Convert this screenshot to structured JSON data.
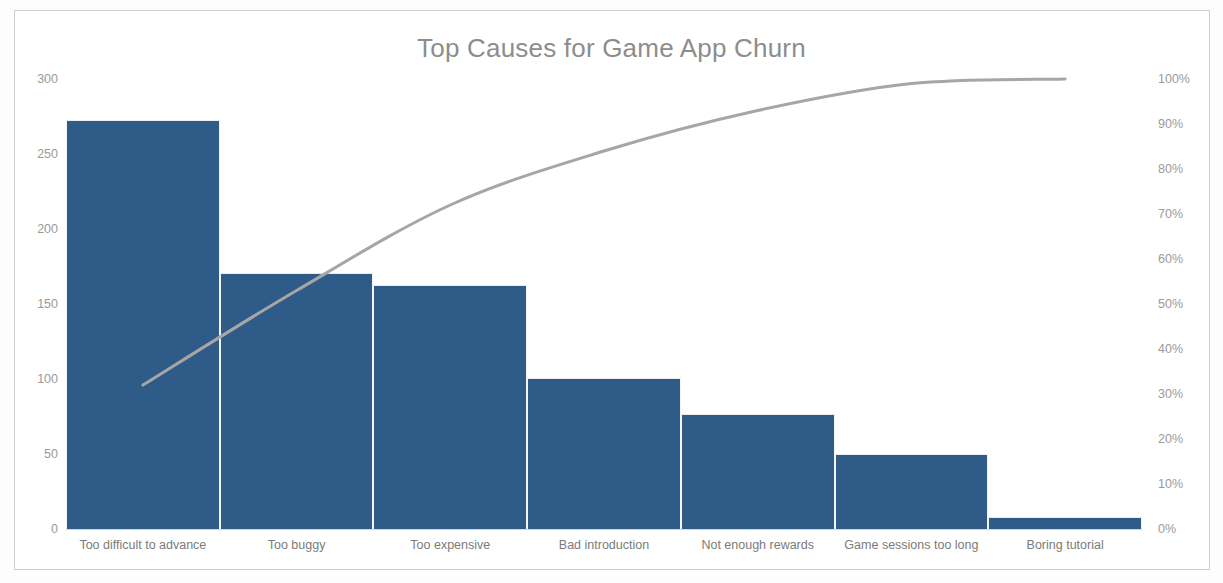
{
  "chart_data": {
    "type": "bar",
    "subtype": "pareto",
    "title": "Top Causes for Game App Churn",
    "xlabel": "",
    "ylabel": "",
    "categories": [
      "Too difficult to advance",
      "Too buggy",
      "Too expensive",
      "Bad introduction",
      "Not enough rewards",
      "Game sessions too long",
      "Boring tutorial"
    ],
    "series": [
      {
        "name": "Count",
        "type": "bar",
        "axis": "left",
        "values": [
          273,
          171,
          163,
          101,
          77,
          50,
          8
        ]
      },
      {
        "name": "Cumulative %",
        "type": "line",
        "axis": "right",
        "values": [
          32,
          53,
          72,
          84,
          93,
          99,
          100
        ]
      }
    ],
    "total": 843,
    "ylim": [
      0,
      300
    ],
    "y2lim": [
      0,
      100
    ],
    "yticks": [
      "0",
      "50",
      "100",
      "150",
      "200",
      "250",
      "300"
    ],
    "ytick_values": [
      0,
      50,
      100,
      150,
      200,
      250,
      300
    ],
    "y2ticks": [
      "0%",
      "10%",
      "20%",
      "30%",
      "40%",
      "50%",
      "60%",
      "70%",
      "80%",
      "90%",
      "100%"
    ],
    "y2tick_values": [
      0,
      10,
      20,
      30,
      40,
      50,
      60,
      70,
      80,
      90,
      100
    ],
    "grid": false,
    "legend": "none",
    "colors": {
      "bar": "#2f5b88",
      "line": "#a6a6a6",
      "title": "#8d8d8d",
      "axis_text": "#9a9a9a",
      "category_text": "#7b7b7b",
      "border": "#cfcfcf",
      "background": "#ffffff"
    }
  }
}
